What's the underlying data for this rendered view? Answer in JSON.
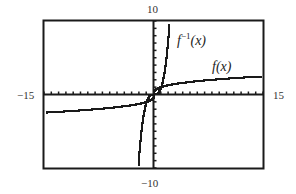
{
  "chart_data": {
    "type": "line",
    "title": "",
    "xlabel": "",
    "ylabel": "",
    "xlim": [
      -15,
      15
    ],
    "ylim": [
      -10,
      10
    ],
    "grid": false,
    "tick_spacing": {
      "x": 1,
      "y": 1
    },
    "window_labels": {
      "ymax": "10",
      "ymin": "-10",
      "xmin": "-15",
      "xmax": "15"
    },
    "series": [
      {
        "name": "f(x)",
        "label_main": "f(x)",
        "description": "cube root function, f(x) = x^(1/3)",
        "x": [
          -15,
          -10,
          -5,
          -1,
          0,
          1,
          5,
          10,
          15
        ],
        "y": [
          -2.47,
          -2.15,
          -1.71,
          -1,
          0,
          1,
          1.71,
          2.15,
          2.47
        ]
      },
      {
        "name": "f^-1(x)",
        "label_base": "f",
        "label_sup": "−1",
        "label_tail": "(x)",
        "description": "inverse function, f^-1(x) = x^3",
        "x": [
          -2.15,
          -2,
          -1.5,
          -1,
          0,
          1,
          1.5,
          2,
          2.15
        ],
        "y": [
          -10,
          -8,
          -3.375,
          -1,
          0,
          1,
          3.375,
          8,
          10
        ]
      }
    ],
    "legend": "curve labels placed directly on plot"
  },
  "labels": {
    "ymax": "10",
    "ymin": "−10",
    "xmin": "−15",
    "xmax": "15",
    "finv_base": "f",
    "finv_sup": "−1",
    "finv_tail": "(x)",
    "f_label": "f(x)"
  },
  "colors": {
    "frame": "#1a1a1a",
    "curve": "#1a1a1a",
    "axis": "#1a1a1a",
    "text": "#333333"
  }
}
